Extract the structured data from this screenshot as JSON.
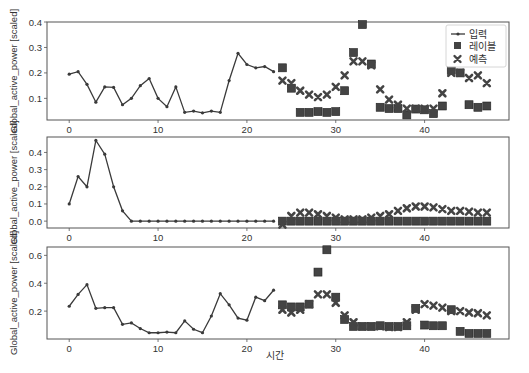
{
  "chart_data": {
    "type": "line",
    "xlabel": "시간",
    "ylabel": "Global_active_power [scaled]",
    "legend": {
      "position": "upper right",
      "entries": [
        "입력",
        "레이블",
        "예측"
      ]
    },
    "colors": {
      "input": "#3a3a3a",
      "label": "#444444",
      "prediction": "#444444",
      "axes": "#555555"
    },
    "x_ticks": [
      0,
      10,
      20,
      30,
      40
    ],
    "xlim": [
      -2.5,
      49.5
    ],
    "panels": [
      {
        "ylim": [
          0.015,
          0.4
        ],
        "y_ticks": [
          0.1,
          0.2,
          0.3,
          0.4
        ],
        "y_tick_labels": [
          "0.1",
          "0.2",
          "0.3",
          "0.4"
        ],
        "input_x_start": 0,
        "inputs": [
          0.195,
          0.205,
          0.155,
          0.085,
          0.145,
          0.143,
          0.075,
          0.1,
          0.15,
          0.178,
          0.1,
          0.067,
          0.145,
          0.045,
          0.05,
          0.043,
          0.05,
          0.045,
          0.17,
          0.277,
          0.233,
          0.22,
          0.225,
          0.205
        ],
        "label_x_start": 24,
        "labels": [
          0.22,
          0.14,
          0.045,
          0.045,
          0.048,
          0.045,
          0.048,
          0.13,
          0.28,
          0.39,
          0.235,
          0.065,
          0.06,
          0.06,
          0.035,
          0.058,
          0.055,
          0.04,
          0.07,
          0.21,
          0.2,
          0.075,
          0.065,
          0.07
        ],
        "predictions": [
          0.17,
          0.16,
          0.13,
          0.115,
          0.105,
          0.115,
          0.145,
          0.19,
          0.245,
          0.245,
          0.23,
          0.135,
          0.095,
          0.075,
          0.06,
          0.06,
          0.06,
          0.06,
          0.12,
          0.2,
          0.2,
          0.18,
          0.19,
          0.16
        ],
        "has_legend": true
      },
      {
        "ylim": [
          -0.04,
          0.49
        ],
        "y_ticks": [
          0.0,
          0.1,
          0.2,
          0.3,
          0.4
        ],
        "y_tick_labels": [
          "0.0",
          "0.1",
          "0.2",
          "0.3",
          "0.4"
        ],
        "input_x_start": 0,
        "inputs": [
          0.1,
          0.26,
          0.2,
          0.47,
          0.39,
          0.2,
          0.06,
          0.0,
          0.0,
          0.0,
          0.0,
          0.0,
          0.0,
          0.0,
          0.0,
          0.0,
          0.0,
          0.0,
          0.0,
          0.0,
          0.0,
          0.0,
          0.0,
          0.0
        ],
        "label_x_start": 24,
        "labels": [
          0.0,
          0.0,
          0.0,
          0.0,
          0.0,
          0.0,
          0.0,
          0.0,
          0.0,
          0.0,
          0.0,
          0.0,
          0.0,
          0.0,
          0.0,
          0.0,
          0.0,
          0.0,
          0.0,
          0.0,
          0.0,
          0.0,
          0.0,
          0.0
        ],
        "predictions": [
          -0.02,
          0.03,
          0.05,
          0.05,
          0.04,
          0.03,
          0.02,
          0.01,
          0.01,
          0.01,
          0.02,
          0.03,
          0.04,
          0.06,
          0.075,
          0.085,
          0.085,
          0.08,
          0.07,
          0.06,
          0.06,
          0.055,
          0.05,
          0.05
        ],
        "has_legend": false
      },
      {
        "ylim": [
          0.0,
          0.66
        ],
        "y_ticks": [
          0.2,
          0.4,
          0.6
        ],
        "y_tick_labels": [
          "0.2",
          "0.4",
          "0.6"
        ],
        "input_x_start": 0,
        "inputs": [
          0.235,
          0.32,
          0.39,
          0.22,
          0.225,
          0.225,
          0.105,
          0.115,
          0.075,
          0.045,
          0.045,
          0.05,
          0.045,
          0.13,
          0.07,
          0.045,
          0.165,
          0.325,
          0.245,
          0.15,
          0.135,
          0.3,
          0.275,
          0.35
        ],
        "label_x_start": 24,
        "labels": [
          0.245,
          0.23,
          0.23,
          0.25,
          0.48,
          0.64,
          0.3,
          0.14,
          0.09,
          0.09,
          0.09,
          0.095,
          0.09,
          0.09,
          0.095,
          0.22,
          0.1,
          0.095,
          0.095,
          0.21,
          0.055,
          0.04,
          0.04,
          0.04
        ],
        "predictions": [
          0.21,
          0.19,
          0.21,
          0.25,
          0.32,
          0.32,
          0.26,
          0.17,
          0.12,
          0.09,
          0.09,
          0.09,
          0.085,
          0.085,
          0.12,
          0.21,
          0.25,
          0.24,
          0.225,
          0.2,
          0.2,
          0.19,
          0.185,
          0.17
        ],
        "has_legend": false
      }
    ]
  }
}
